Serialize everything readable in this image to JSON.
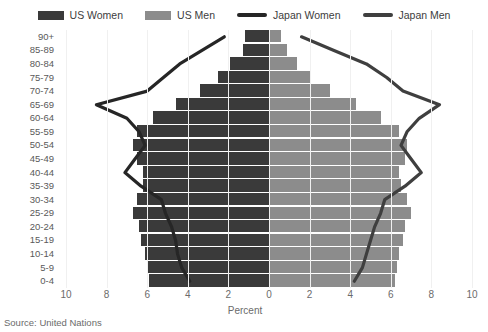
{
  "legend": {
    "items": [
      {
        "label": "US Women",
        "kind": "swatch",
        "color": "#3a3a3a",
        "name": "legend-us-women"
      },
      {
        "label": "US Men",
        "kind": "swatch",
        "color": "#8c8c8c",
        "name": "legend-us-men"
      },
      {
        "label": "Japan Women",
        "kind": "line",
        "color": "#262626",
        "name": "legend-japan-women"
      },
      {
        "label": "Japan Men",
        "kind": "line",
        "color": "#3f3f3f",
        "name": "legend-japan-men"
      }
    ]
  },
  "axis": {
    "x_title": "Percent",
    "x_ticks": [
      "10",
      "8",
      "6",
      "4",
      "2",
      "0",
      "2",
      "4",
      "6",
      "8",
      "10"
    ]
  },
  "source": "Source: United Nations",
  "colors": {
    "us_women_bar": "#3a3a3a",
    "us_men_bar": "#8c8c8c",
    "japan_women_line": "#262626",
    "japan_men_line": "#3f3f3f",
    "grid": "#f0f0f0",
    "background": "#ffffff"
  },
  "chart_data": {
    "type": "bar",
    "subtype": "population-pyramid",
    "title": "",
    "xlabel": "Percent",
    "ylabel": "",
    "xlim": [
      -10,
      10
    ],
    "xticks": [
      -10,
      -8,
      -6,
      -4,
      -2,
      0,
      2,
      4,
      6,
      8,
      10
    ],
    "xtick_labels": [
      "10",
      "8",
      "6",
      "4",
      "2",
      "0",
      "2",
      "4",
      "6",
      "8",
      "10"
    ],
    "grid": false,
    "legend_position": "top",
    "categories": [
      "0-4",
      "5-9",
      "10-14",
      "15-19",
      "20-24",
      "25-29",
      "30-34",
      "35-39",
      "40-44",
      "45-49",
      "50-54",
      "55-59",
      "60-64",
      "65-69",
      "70-74",
      "75-79",
      "80-84",
      "85-89",
      "90+"
    ],
    "note": "Left side = women (plotted to the left of 0), right side = men. Bars are US; lines are Japan.",
    "series": [
      {
        "name": "US Women",
        "side": "left",
        "render": "bar",
        "color": "#3a3a3a",
        "values": [
          5.9,
          6.0,
          6.1,
          6.3,
          6.4,
          6.7,
          6.5,
          6.2,
          6.2,
          6.5,
          6.7,
          6.5,
          5.7,
          4.6,
          3.4,
          2.5,
          1.9,
          1.3,
          1.2
        ]
      },
      {
        "name": "US Men",
        "side": "right",
        "render": "bar",
        "color": "#8c8c8c",
        "values": [
          6.2,
          6.3,
          6.4,
          6.6,
          6.7,
          7.0,
          6.8,
          6.5,
          6.4,
          6.7,
          6.8,
          6.4,
          5.5,
          4.3,
          3.0,
          2.0,
          1.4,
          0.9,
          0.6
        ]
      },
      {
        "name": "Japan Women",
        "side": "left",
        "render": "line",
        "color": "#262626",
        "values": [
          3.9,
          4.3,
          4.5,
          4.6,
          4.8,
          5.1,
          5.3,
          6.3,
          7.1,
          6.6,
          6.1,
          6.4,
          7.0,
          8.5,
          6.0,
          5.2,
          4.4,
          3.3,
          2.2
        ]
      },
      {
        "name": "Japan Men",
        "side": "right",
        "render": "line",
        "color": "#3f3f3f",
        "values": [
          4.2,
          4.6,
          4.8,
          5.0,
          5.2,
          5.5,
          5.7,
          6.7,
          7.5,
          7.0,
          6.5,
          6.8,
          7.4,
          8.4,
          6.6,
          5.8,
          4.8,
          3.2,
          1.6
        ]
      }
    ]
  }
}
